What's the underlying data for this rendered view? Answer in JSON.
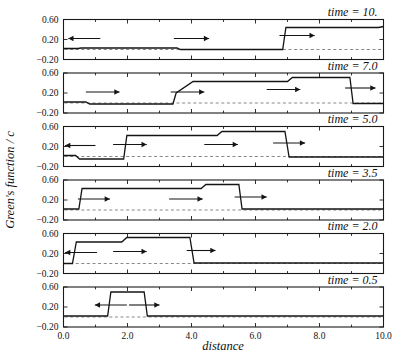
{
  "figure": {
    "ylabel": "Green's function / c",
    "xlabel": "distance",
    "background_color": "#ffffff",
    "line_color": "#141414",
    "zero_line_color": "#7a7a7a"
  },
  "chart_data": {
    "type": "line",
    "title": "",
    "subtitle": "",
    "xlabel": "distance",
    "ylabel": "Green's function / c",
    "xlim": [
      0.0,
      10.0
    ],
    "ylim": [
      -0.2,
      0.6
    ],
    "xticks": [
      0.0,
      2.0,
      4.0,
      6.0,
      8.0,
      10.0
    ],
    "xticklabels": [
      "0.0",
      "2.0",
      "4.0",
      "6.0",
      "8.0",
      "10.0"
    ],
    "yticks": [
      -0.2,
      0.2,
      0.6
    ],
    "yticklabels": [
      "-0.20",
      "0.20",
      "0.60"
    ],
    "minor_xticks": [
      1.0,
      3.0,
      5.0,
      7.0,
      9.0
    ],
    "grid": false,
    "legend": false,
    "zero_reference_line": 0.0,
    "panel_count": 6,
    "panel_order": "top_to_bottom_decreasing_time",
    "panels": [
      {
        "id": "panel-time-10",
        "label": "time = 10.",
        "time": 10.0,
        "x": [
          0.0,
          0.45,
          0.55,
          3.55,
          3.65,
          6.85,
          6.95,
          9.85,
          10.0
        ],
        "y": [
          0.02,
          0.02,
          0.03,
          0.03,
          0.0,
          0.0,
          0.44,
          0.44,
          0.46
        ],
        "arrows": [
          {
            "x_start": 1.15,
            "x_end": 0.15,
            "y": 0.22,
            "direction": "left"
          },
          {
            "x_start": 3.45,
            "x_end": 4.55,
            "y": 0.22,
            "direction": "right"
          },
          {
            "x_start": 6.75,
            "x_end": 7.85,
            "y": 0.28,
            "direction": "right"
          }
        ]
      },
      {
        "id": "panel-time-7",
        "label": "time = 7.0",
        "time": 7.0,
        "x": [
          0.0,
          0.7,
          0.82,
          3.42,
          3.52,
          4.05,
          7.0,
          7.15,
          8.95,
          9.05,
          10.0
        ],
        "y": [
          0.02,
          0.02,
          -0.02,
          -0.02,
          0.2,
          0.43,
          0.43,
          0.51,
          0.51,
          -0.01,
          -0.01
        ],
        "arrows": [
          {
            "x_start": 0.7,
            "x_end": 1.75,
            "y": 0.22,
            "direction": "right"
          },
          {
            "x_start": 3.35,
            "x_end": 4.4,
            "y": 0.22,
            "direction": "right"
          },
          {
            "x_start": 6.35,
            "x_end": 7.4,
            "y": 0.27,
            "direction": "right"
          },
          {
            "x_start": 8.8,
            "x_end": 9.75,
            "y": 0.3,
            "direction": "right"
          }
        ]
      },
      {
        "id": "panel-time-5",
        "label": "time = 5.0",
        "time": 5.0,
        "x": [
          0.0,
          0.38,
          0.5,
          1.88,
          1.98,
          4.8,
          4.95,
          6.92,
          7.05,
          10.0
        ],
        "y": [
          0.02,
          0.02,
          -0.05,
          -0.05,
          0.42,
          0.42,
          0.5,
          0.5,
          -0.01,
          -0.01
        ],
        "arrows": [
          {
            "x_start": 1.0,
            "x_end": 0.05,
            "y": 0.22,
            "direction": "left"
          },
          {
            "x_start": 1.55,
            "x_end": 2.6,
            "y": 0.24,
            "direction": "right"
          },
          {
            "x_start": 4.4,
            "x_end": 5.45,
            "y": 0.24,
            "direction": "right"
          },
          {
            "x_start": 6.55,
            "x_end": 7.55,
            "y": 0.27,
            "direction": "right"
          }
        ]
      },
      {
        "id": "panel-time-3-5",
        "label": "time = 3.5",
        "time": 3.5,
        "x": [
          0.0,
          0.48,
          0.58,
          4.3,
          4.45,
          5.48,
          5.58,
          10.0
        ],
        "y": [
          0.02,
          0.02,
          0.43,
          0.43,
          0.51,
          0.51,
          0.02,
          0.02
        ],
        "arrows": [
          {
            "x_start": 0.45,
            "x_end": 1.45,
            "y": 0.22,
            "direction": "right"
          },
          {
            "x_start": 3.3,
            "x_end": 4.35,
            "y": 0.22,
            "direction": "right"
          },
          {
            "x_start": 5.35,
            "x_end": 6.35,
            "y": 0.26,
            "direction": "right"
          }
        ]
      },
      {
        "id": "panel-time-2",
        "label": "time = 2.0",
        "time": 2.0,
        "x": [
          0.0,
          0.28,
          0.4,
          1.82,
          1.98,
          3.95,
          4.08,
          10.0
        ],
        "y": [
          0.0,
          0.0,
          0.43,
          0.43,
          0.52,
          0.52,
          0.01,
          0.01
        ],
        "arrows": [
          {
            "x_start": 1.05,
            "x_end": 0.05,
            "y": 0.22,
            "direction": "left"
          },
          {
            "x_start": 1.55,
            "x_end": 2.6,
            "y": 0.24,
            "direction": "right"
          },
          {
            "x_start": 3.85,
            "x_end": 4.75,
            "y": 0.26,
            "direction": "right"
          }
        ]
      },
      {
        "id": "panel-time-0-5",
        "label": "time = 0.5",
        "time": 0.5,
        "x": [
          0.0,
          1.38,
          1.48,
          2.52,
          2.62,
          10.0
        ],
        "y": [
          0.02,
          0.02,
          0.5,
          0.5,
          0.02,
          0.02
        ],
        "arrows": [
          {
            "x_start": 1.98,
            "x_end": 0.98,
            "y": 0.24,
            "direction": "left"
          },
          {
            "x_start": 2.05,
            "x_end": 3.0,
            "y": 0.24,
            "direction": "right"
          }
        ]
      }
    ]
  }
}
